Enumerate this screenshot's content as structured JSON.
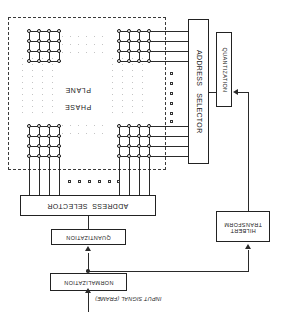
{
  "figure": {
    "orientation": "rotated-180",
    "ink_color": "#2a2a2a"
  },
  "plane": {
    "label_line1": "PHASE",
    "label_line2": "PLANE",
    "grid_nodes_per_cluster": 16,
    "grid_rows": 4,
    "grid_cols": 4,
    "clusters": 4
  },
  "blocks": {
    "address_selector_vertical": "ADDRESS   SELECTOR",
    "address_selector_horizontal": "ADDRESS  SELECTOR",
    "quantization_vertical": "QUANTIZATION",
    "quantization_horizontal": "QUANTIZATION",
    "hilbert_transform_line1": "HILBERT",
    "hilbert_transform_line2": "TRANSFORM",
    "normalization": "NORMALIZATION"
  },
  "signals": {
    "input": "INPUT SIGNAL (FRAME)"
  },
  "ellipsis": {
    "horizontal_count": 6,
    "vertical_count": 6
  }
}
